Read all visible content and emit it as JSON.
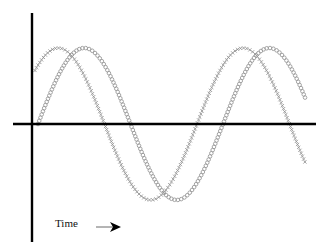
{
  "chart_data": {
    "type": "line",
    "title": "",
    "xlabel": "Time",
    "ylabel": "",
    "grid": false,
    "legend": null,
    "annotations": [
      {
        "text": "Time",
        "arrow": "right",
        "position": "bottom-left"
      }
    ],
    "axes": {
      "y_axis_x_px": 32,
      "y_axis_top_px": 13,
      "y_axis_bottom_px": 242,
      "x_axis_y_px": 124,
      "x_axis_left_px": 13,
      "x_axis_right_px": 316
    },
    "series": [
      {
        "name": "wave-crosses",
        "marker": "x",
        "color": "#8a8a8a",
        "shape": "sine",
        "amplitude_px": 76,
        "period_px": 185,
        "zero_cross_rising_px": 12,
        "x_start_px": 35,
        "x_end_px": 306,
        "marker_spacing_px": 3.2,
        "marker_size_px": 3.2
      },
      {
        "name": "wave-circles",
        "marker": "o",
        "color": "#9a9a9a",
        "shape": "sine",
        "amplitude_px": 76,
        "period_px": 185,
        "zero_cross_rising_px": 38,
        "x_start_px": 38,
        "x_end_px": 306,
        "marker_spacing_px": 3.4,
        "marker_size_px": 3.6
      }
    ]
  },
  "labels": {
    "time": "Time"
  },
  "arrow": {
    "x1": 96,
    "x2": 121,
    "y": 227
  }
}
